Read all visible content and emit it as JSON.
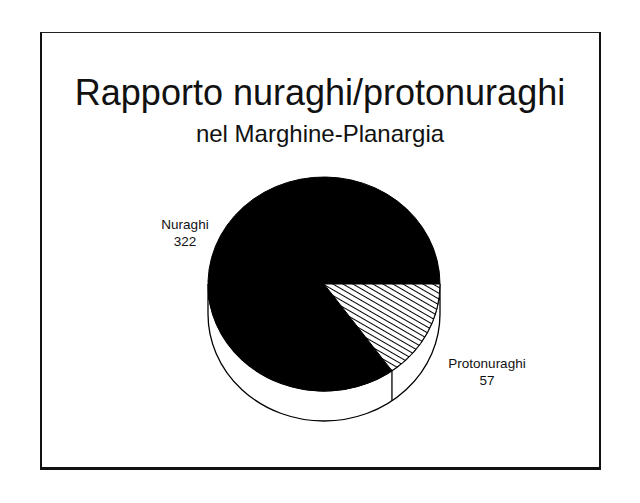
{
  "chart_data": {
    "type": "pie",
    "style": "3d",
    "title": "Rapporto nuraghi/protonuraghi",
    "subtitle": "nel Marghine-Planargia",
    "slices": [
      {
        "label": "Nuraghi",
        "value": 322,
        "fill": "#000000",
        "pattern": "solid"
      },
      {
        "label": "Protonuraghi",
        "value": 57,
        "fill": "#ffffff",
        "pattern": "diagonal-hatch"
      }
    ],
    "labels": {
      "nuraghi": {
        "name": "Nuraghi",
        "value": "322"
      },
      "protonuraghi": {
        "name": "Protonuraghi",
        "value": "57"
      }
    }
  }
}
